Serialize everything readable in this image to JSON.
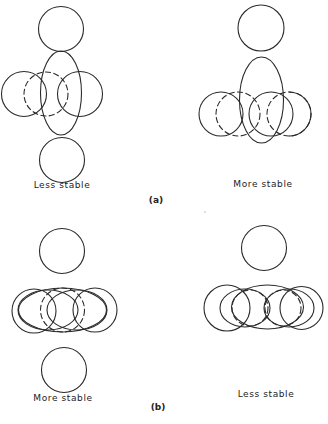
{
  "figure": {
    "stroke_color": "#2a2a2a",
    "panels": [
      {
        "id": "a-left",
        "label": "Less stable",
        "label_pos": [
          62,
          186
        ],
        "shapes": [
          {
            "type": "circle",
            "cx": 61,
            "cy": 29,
            "r": 22.5,
            "style": "solid"
          },
          {
            "type": "ellipse",
            "cx": 61,
            "cy": 93,
            "rx": 20.5,
            "ry": 42,
            "style": "solid"
          },
          {
            "type": "circle",
            "cx": 24,
            "cy": 94,
            "r": 22.5,
            "style": "solid"
          },
          {
            "type": "circle",
            "cx": 46,
            "cy": 94,
            "r": 22,
            "style": "dashed"
          },
          {
            "type": "circle",
            "cx": 80,
            "cy": 94,
            "r": 22.5,
            "style": "solid"
          },
          {
            "type": "circle",
            "cx": 62,
            "cy": 160,
            "r": 22.5,
            "style": "solid"
          }
        ]
      },
      {
        "id": "a-right",
        "label": "More stable",
        "label_pos": [
          263,
          185
        ],
        "shapes": [
          {
            "type": "circle",
            "cx": 261,
            "cy": 28,
            "r": 23,
            "style": "solid"
          },
          {
            "type": "ellipse",
            "cx": 261.5,
            "cy": 100,
            "rx": 22,
            "ry": 43,
            "style": "solid"
          },
          {
            "type": "circle",
            "cx": 221,
            "cy": 114,
            "r": 22,
            "style": "solid"
          },
          {
            "type": "circle",
            "cx": 238,
            "cy": 114,
            "r": 22,
            "style": "dashed"
          },
          {
            "type": "circle",
            "cx": 271,
            "cy": 114,
            "r": 22,
            "style": "solid"
          },
          {
            "type": "circle",
            "cx": 289,
            "cy": 114,
            "r": 22,
            "style": "dashed"
          },
          {
            "type": "arc",
            "d": "M 289 92 A 22 22 0 0 1 289 136",
            "style": "solid"
          }
        ]
      },
      {
        "id": "b-left",
        "label": "More stable",
        "label_pos": [
          63,
          399
        ],
        "shapes": [
          {
            "type": "circle",
            "cx": 62,
            "cy": 251,
            "r": 22.5,
            "style": "solid"
          },
          {
            "type": "circle",
            "cx": 34,
            "cy": 311,
            "r": 22,
            "style": "solid"
          },
          {
            "type": "ellipse",
            "cx": 62.5,
            "cy": 310,
            "rx": 44,
            "ry": 22,
            "style": "solid"
          },
          {
            "type": "ellipse",
            "cx": 48,
            "cy": 310,
            "rx": 30,
            "ry": 20,
            "style": "solid"
          },
          {
            "type": "ellipse",
            "cx": 77,
            "cy": 310,
            "rx": 30,
            "ry": 20,
            "style": "solid"
          },
          {
            "type": "circle",
            "cx": 62.5,
            "cy": 310,
            "r": 22,
            "style": "dashed"
          },
          {
            "type": "circle",
            "cx": 95,
            "cy": 310,
            "r": 22,
            "style": "solid"
          },
          {
            "type": "circle",
            "cx": 64,
            "cy": 370,
            "r": 22.5,
            "style": "solid"
          }
        ]
      },
      {
        "id": "b-right",
        "label": "Less stable",
        "label_pos": [
          266,
          395
        ],
        "shapes": [
          {
            "type": "circle",
            "cx": 264,
            "cy": 248,
            "r": 22.5,
            "style": "solid"
          },
          {
            "type": "circle",
            "cx": 227,
            "cy": 308,
            "r": 23,
            "style": "solid"
          },
          {
            "type": "ellipse",
            "cx": 267.5,
            "cy": 307,
            "rx": 36,
            "ry": 22,
            "style": "solid"
          },
          {
            "type": "ellipse",
            "cx": 245,
            "cy": 308,
            "rx": 25,
            "ry": 19,
            "style": "solid"
          },
          {
            "type": "ellipse",
            "cx": 289,
            "cy": 308,
            "rx": 25,
            "ry": 19,
            "style": "solid"
          },
          {
            "type": "circle",
            "cx": 250,
            "cy": 308,
            "r": 18,
            "style": "dashed"
          },
          {
            "type": "circle",
            "cx": 283,
            "cy": 308,
            "r": 18,
            "style": "dashed"
          },
          {
            "type": "circle",
            "cx": 301.5,
            "cy": 308,
            "r": 21.5,
            "style": "solid"
          }
        ]
      }
    ],
    "subfigure_labels": [
      {
        "text": "(a)",
        "pos": [
          156,
          201
        ]
      },
      {
        "text": "(b)",
        "pos": [
          158,
          408
        ]
      }
    ],
    "specks": [
      {
        "cx": 205,
        "cy": 212,
        "r": 0.6
      }
    ]
  }
}
